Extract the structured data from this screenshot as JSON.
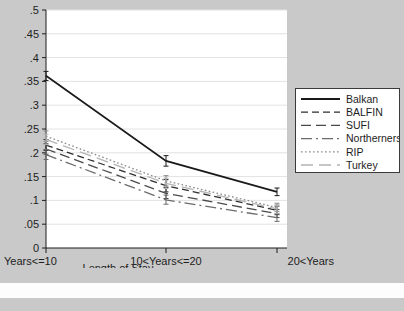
{
  "chart_data": {
    "type": "line",
    "title": "",
    "xlabel": "Length of Stay",
    "ylabel": "",
    "categories": [
      "Years<=10",
      "10<Years<=20",
      "20<Years"
    ],
    "ylim": [
      0,
      0.5
    ],
    "yticks": [
      0,
      0.05,
      0.1,
      0.15,
      0.2,
      0.25,
      0.3,
      0.35,
      0.4,
      0.45,
      0.5
    ],
    "ytick_labels": [
      "0",
      ".05",
      ".1",
      ".15",
      ".2",
      ".25",
      ".3",
      ".35",
      ".4",
      ".45",
      ".5"
    ],
    "grid": true,
    "legend_position": "right-outside",
    "error_bars": true,
    "series": [
      {
        "name": "Balkan",
        "style": "solid",
        "color": "#1a1a1a",
        "values": [
          0.362,
          0.183,
          0.118
        ],
        "err_low": [
          0.352,
          0.172,
          0.11
        ],
        "err_high": [
          0.371,
          0.194,
          0.126
        ]
      },
      {
        "name": "BALFIN",
        "style": "dashed",
        "color": "#2e2e2e",
        "values": [
          0.216,
          0.131,
          0.079
        ],
        "err_low": [
          0.205,
          0.118,
          0.07
        ],
        "err_high": [
          0.228,
          0.144,
          0.088
        ]
      },
      {
        "name": "SUFI",
        "style": "long-dash",
        "color": "#4a4a4a",
        "values": [
          0.208,
          0.115,
          0.072
        ],
        "err_low": [
          0.197,
          0.104,
          0.064
        ],
        "err_high": [
          0.219,
          0.127,
          0.081
        ]
      },
      {
        "name": "Northerners",
        "style": "dash-dot",
        "color": "#6b6b6b",
        "values": [
          0.196,
          0.101,
          0.064
        ],
        "err_low": [
          0.186,
          0.092,
          0.056
        ],
        "err_high": [
          0.207,
          0.111,
          0.072
        ]
      },
      {
        "name": "RIP",
        "style": "dotted",
        "color": "#8a8a8a",
        "values": [
          0.235,
          0.141,
          0.085
        ],
        "err_low": [
          0.224,
          0.13,
          0.077
        ],
        "err_high": [
          0.246,
          0.152,
          0.094
        ]
      },
      {
        "name": "Turkey",
        "style": "faint-long-dash",
        "color": "#b4b4b4",
        "values": [
          0.228,
          0.136,
          0.082
        ],
        "err_low": [
          0.217,
          0.125,
          0.073
        ],
        "err_high": [
          0.239,
          0.147,
          0.091
        ]
      }
    ]
  },
  "legend": {
    "items": [
      {
        "label": "Balkan"
      },
      {
        "label": "BALFIN"
      },
      {
        "label": "SUFI"
      },
      {
        "label": "Northerners"
      },
      {
        "label": "RIP"
      },
      {
        "label": "Turkey"
      }
    ]
  }
}
